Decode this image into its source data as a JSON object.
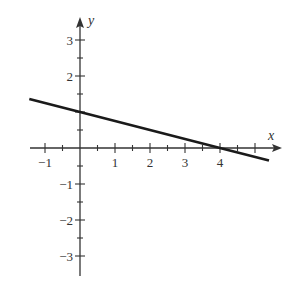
{
  "chart_data": {
    "type": "line",
    "title": "",
    "xlabel": "x",
    "ylabel": "y",
    "xlim": [
      -1.45,
      5.7
    ],
    "ylim": [
      -3.5,
      3.6
    ],
    "grid": false,
    "x_ticks": [
      -1,
      1,
      2,
      3,
      4
    ],
    "y_ticks": [
      -3,
      -2,
      -1,
      2,
      3
    ],
    "x_tick_labels": [
      "−1",
      "1",
      "2",
      "3",
      "4"
    ],
    "y_tick_labels": [
      "−3",
      "−2",
      "−1",
      "2",
      "3"
    ],
    "minor_tick_step": 0.5,
    "series": [
      {
        "name": "line",
        "equation": "y = 1 - x/4",
        "x": [
          -1.45,
          0,
          4,
          5.4
        ],
        "y": [
          1.3625,
          1,
          0,
          -0.35
        ]
      }
    ],
    "x_intercept": 4,
    "y_intercept": 1
  },
  "colors": {
    "axis": "#333333",
    "line": "#1a1a1a",
    "background": "#ffffff"
  }
}
